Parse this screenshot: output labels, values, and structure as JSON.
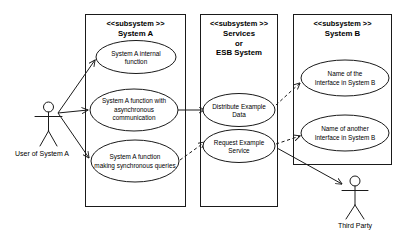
{
  "diagram": {
    "stroke_color": "#1a1a1a",
    "background_color": "#ffffff"
  },
  "subsystems": [
    {
      "id": "system-a",
      "stereotype": "<<subsystem >>",
      "name": "System A",
      "use_cases": [
        {
          "id": "uc-a-internal",
          "line1": "System A internal",
          "line2": "function",
          "line3": ""
        },
        {
          "id": "uc-a-async",
          "line1": "System A function with",
          "line2": "asynchronous",
          "line3": "communication"
        },
        {
          "id": "uc-a-sync",
          "line1": "System A function",
          "line2": "making synchronous queries",
          "line3": ""
        }
      ]
    },
    {
      "id": "services-esb",
      "stereotype": "<<subsystem >>",
      "name_line1": "Services",
      "name_line2": "or",
      "name_line3": "ESB System",
      "use_cases": [
        {
          "id": "uc-distribute",
          "line1": "Distribute Example",
          "line2": "Data",
          "line3": ""
        },
        {
          "id": "uc-request",
          "line1": "Request Example",
          "line2": "Service",
          "line3": ""
        }
      ]
    },
    {
      "id": "system-b",
      "stereotype": "<<subsystem >>",
      "name": "System B",
      "use_cases": [
        {
          "id": "uc-b-interface1",
          "line1": "Name of the",
          "line2": "Interface in System B",
          "line3": ""
        },
        {
          "id": "uc-b-interface2",
          "line1": "Name of another",
          "line2": "Interface in System B",
          "line3": ""
        }
      ]
    }
  ],
  "actors": [
    {
      "id": "actor-user-a",
      "label": "User of System A"
    },
    {
      "id": "actor-third-party",
      "label": "Third Party"
    }
  ],
  "connections": [
    {
      "id": "user-to-internal",
      "style": "solid",
      "from": "actor-user-a",
      "to": "uc-a-internal"
    },
    {
      "id": "user-to-async",
      "style": "solid",
      "from": "actor-user-a",
      "to": "uc-a-async"
    },
    {
      "id": "user-to-sync",
      "style": "solid",
      "from": "actor-user-a",
      "to": "uc-a-sync"
    },
    {
      "id": "async-to-distribute",
      "style": "solid",
      "from": "uc-a-async",
      "to": "uc-distribute"
    },
    {
      "id": "sync-to-request",
      "style": "dashed",
      "from": "uc-a-sync",
      "to": "uc-request"
    },
    {
      "id": "distribute-to-interface1",
      "style": "dashed",
      "from": "uc-distribute",
      "to": "uc-b-interface1"
    },
    {
      "id": "request-to-interface2",
      "style": "dashed",
      "from": "uc-request",
      "to": "uc-b-interface2"
    },
    {
      "id": "request-to-third-party",
      "style": "solid",
      "from": "uc-request",
      "to": "actor-third-party"
    }
  ]
}
